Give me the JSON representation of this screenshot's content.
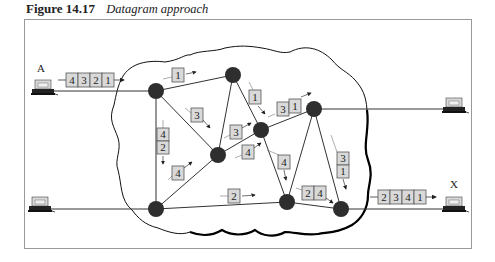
{
  "figure": {
    "number": "Figure 14.17",
    "title": "Datagram approach"
  },
  "hosts": {
    "sender": {
      "label": "A"
    },
    "receiver": {
      "label": "X"
    }
  },
  "packets": {
    "source_queue": [
      "4",
      "3",
      "2",
      "1"
    ],
    "destination_queue": [
      "2",
      "3",
      "4",
      "1"
    ],
    "in_transit": [
      {
        "cells": [
          "1"
        ]
      },
      {
        "cells": [
          "3"
        ]
      },
      {
        "cells": [
          "4",
          "2"
        ]
      },
      {
        "cells": [
          "4"
        ]
      },
      {
        "cells": [
          "3"
        ]
      },
      {
        "cells": [
          "4"
        ]
      },
      {
        "cells": [
          "1"
        ]
      },
      {
        "cells": [
          "3",
          "1"
        ]
      },
      {
        "cells": [
          "4"
        ]
      },
      {
        "cells": [
          "2"
        ]
      },
      {
        "cells": [
          "2",
          "4"
        ]
      },
      {
        "cells": [
          "3",
          "1"
        ]
      }
    ]
  },
  "colors": {
    "node": "#333333",
    "packet_fill": "#d9d9d9",
    "frame": "#999999"
  }
}
